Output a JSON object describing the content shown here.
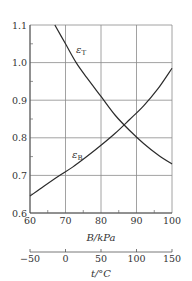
{
  "chart_data": {
    "type": "line",
    "title": "",
    "xlabel": "B/kPa",
    "ylabel": "",
    "xlim": [
      60,
      100
    ],
    "ylim": [
      0.6,
      1.1
    ],
    "x_ticks": [
      60,
      70,
      80,
      90,
      100
    ],
    "x_tick_labels": [
      "60",
      "70",
      "80",
      "90",
      "100"
    ],
    "y_ticks": [
      0.6,
      0.7,
      0.8,
      0.9,
      1.0,
      1.1
    ],
    "y_tick_labels": [
      "0.6",
      "0.7",
      "0.8",
      "0.9",
      "1.0",
      "1.1"
    ],
    "grid": true,
    "series": [
      {
        "name": "εT",
        "label_main": "ε",
        "label_sub": "T",
        "x": [
          67,
          70,
          73,
          76,
          80,
          84,
          88,
          92,
          96,
          100
        ],
        "y": [
          1.1,
          1.05,
          1.0,
          0.96,
          0.91,
          0.86,
          0.82,
          0.785,
          0.755,
          0.73
        ]
      },
      {
        "name": "εB",
        "label_main": "ε",
        "label_sub": "B",
        "x": [
          60,
          64,
          68,
          72,
          76,
          80,
          84,
          88,
          92,
          96,
          100
        ],
        "y": [
          0.645,
          0.672,
          0.698,
          0.722,
          0.75,
          0.78,
          0.812,
          0.848,
          0.885,
          0.93,
          0.985
        ]
      }
    ],
    "secondary_axis": {
      "label": "t/°C",
      "range": [
        -50,
        150
      ],
      "ticks": [
        -50,
        0,
        50,
        100,
        150
      ],
      "tick_labels": [
        "−50",
        "0",
        "50",
        "100",
        "150"
      ]
    },
    "legend": "inline labels on curves"
  }
}
